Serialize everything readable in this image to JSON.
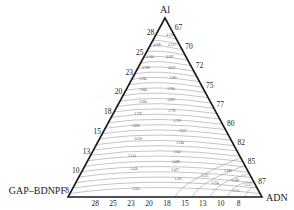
{
  "diagram": {
    "type": "ternary-contour",
    "vertices": {
      "top": {
        "label": "Al",
        "x": 165,
        "y": 18
      },
      "left": {
        "label": "GAP–BDNPF",
        "x": 68,
        "y": 197
      },
      "right": {
        "label": "ADN",
        "x": 262,
        "y": 197
      }
    },
    "left_ticks": [
      "28",
      "25",
      "23",
      "20",
      "18",
      "15",
      "13",
      "10",
      "8"
    ],
    "right_ticks": [
      "67",
      "70",
      "72",
      "75",
      "77",
      "80",
      "82",
      "85",
      "87"
    ],
    "bottom_ticks": [
      "28",
      "25",
      "23",
      "20",
      "18",
      "15",
      "13",
      "10",
      "8"
    ],
    "contour_labels": [
      {
        "text": "4.136",
        "x": 170,
        "y": 36
      },
      {
        "text": "4.088",
        "x": 157,
        "y": 46
      },
      {
        "text": "4.111",
        "x": 172,
        "y": 46
      },
      {
        "text": "4.044",
        "x": 150,
        "y": 58
      },
      {
        "text": "4.067",
        "x": 170,
        "y": 58
      },
      {
        "text": "3.998",
        "x": 146,
        "y": 69
      },
      {
        "text": "4.021",
        "x": 172,
        "y": 69
      },
      {
        "text": "3.945",
        "x": 143,
        "y": 80
      },
      {
        "text": "3.983",
        "x": 173,
        "y": 79
      },
      {
        "text": "3.884",
        "x": 143,
        "y": 91
      },
      {
        "text": "3.904",
        "x": 171,
        "y": 90
      },
      {
        "text": "3.826",
        "x": 143,
        "y": 103
      },
      {
        "text": "3.859",
        "x": 171,
        "y": 101
      },
      {
        "text": "3.791",
        "x": 172,
        "y": 112
      },
      {
        "text": "3.759",
        "x": 138,
        "y": 115
      },
      {
        "text": "3.729",
        "x": 177,
        "y": 122
      },
      {
        "text": "3.693",
        "x": 136,
        "y": 127
      },
      {
        "text": "3.637",
        "x": 183,
        "y": 132
      },
      {
        "text": "3.618",
        "x": 138,
        "y": 140
      },
      {
        "text": "3.594",
        "x": 180,
        "y": 144
      },
      {
        "text": "3.543",
        "x": 177,
        "y": 153
      },
      {
        "text": "3.514",
        "x": 132,
        "y": 157
      },
      {
        "text": "3.488",
        "x": 176,
        "y": 163
      },
      {
        "text": "3.436",
        "x": 134,
        "y": 170
      },
      {
        "text": "3.427",
        "x": 175,
        "y": 171
      },
      {
        "text": "3.365",
        "x": 178,
        "y": 180
      },
      {
        "text": "3.321",
        "x": 205,
        "y": 177
      },
      {
        "text": "3.283",
        "x": 228,
        "y": 172
      },
      {
        "text": "3.254",
        "x": 215,
        "y": 184
      },
      {
        "text": "3.189",
        "x": 235,
        "y": 182
      },
      {
        "text": "3.112",
        "x": 248,
        "y": 186
      },
      {
        "text": "3.151",
        "x": 236,
        "y": 192
      },
      {
        "text": "3.363",
        "x": 136,
        "y": 190
      }
    ],
    "colors": {
      "edge": "#1a1a1a",
      "contour": "#8a8a8a",
      "text": "#222222"
    }
  }
}
